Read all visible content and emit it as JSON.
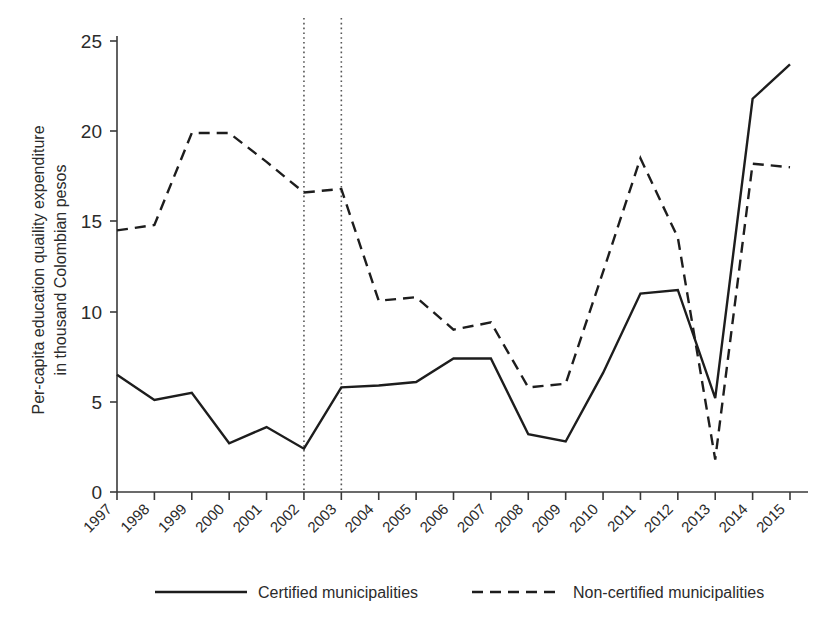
{
  "chart_data": {
    "type": "line",
    "title": "",
    "xlabel": "",
    "ylabel": "Per-capita education quaility expenditure in thousand Colombian pesos",
    "ylabel_line1": "Per-capita education quaility expenditure",
    "ylabel_line2": "in thousand Colombian pesos",
    "x": [
      1997,
      1998,
      1999,
      2000,
      2001,
      2002,
      2003,
      2004,
      2005,
      2006,
      2007,
      2008,
      2009,
      2010,
      2011,
      2012,
      2013,
      2014,
      2015
    ],
    "categories": [
      "1997",
      "1998",
      "1999",
      "2000",
      "2001",
      "2002",
      "2003",
      "2004",
      "2005",
      "2006",
      "2007",
      "2008",
      "2009",
      "2010",
      "2011",
      "2012",
      "2013",
      "2014",
      "2015"
    ],
    "xlim": [
      1997,
      2015
    ],
    "ylim": [
      0,
      25
    ],
    "yticks": [
      0,
      5,
      10,
      15,
      20,
      25
    ],
    "ytick_labels": [
      "0",
      "5",
      "10",
      "15",
      "20",
      "25"
    ],
    "grid": false,
    "legend_position": "bottom",
    "series": [
      {
        "name": "Certified municipalities",
        "style": "solid",
        "values": [
          6.5,
          5.1,
          5.5,
          2.7,
          3.6,
          2.4,
          5.8,
          5.9,
          6.1,
          7.4,
          7.4,
          3.2,
          2.8,
          6.6,
          11.0,
          11.2,
          5.2,
          21.8,
          23.7
        ]
      },
      {
        "name": "Non-certified municipalities",
        "style": "dashed",
        "values": [
          14.5,
          14.8,
          19.9,
          19.9,
          18.3,
          16.6,
          16.8,
          10.6,
          10.8,
          9.0,
          9.4,
          5.8,
          6.0,
          12.2,
          18.5,
          14.1,
          1.8,
          18.2,
          18.0
        ]
      }
    ],
    "annotations": [
      {
        "name": "reference-line-2002",
        "x": 2002,
        "style": "dotted-vertical"
      },
      {
        "name": "reference-line-2003",
        "x": 2003,
        "style": "dotted-vertical"
      }
    ],
    "colors": {
      "line": "#1d1d1d",
      "axis": "#3a3a3a",
      "reference_line": "#555555",
      "background": "#ffffff"
    }
  },
  "legend": {
    "items": [
      {
        "label": "Certified municipalities",
        "style": "solid"
      },
      {
        "label": "Non-certified municipalities",
        "style": "dashed"
      }
    ]
  }
}
